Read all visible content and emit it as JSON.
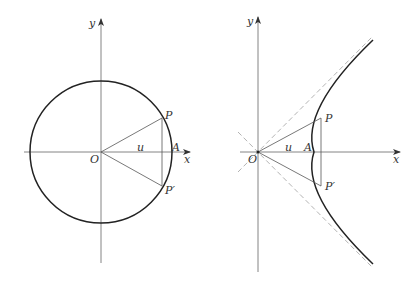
{
  "figure": {
    "colors": {
      "axis": "#555555",
      "curve": "#222222",
      "line": "#555555",
      "asymptote": "#aaaaaa",
      "label": "#333333"
    }
  },
  "left_diagram": {
    "name": "circle",
    "labels": {
      "y_axis": "y",
      "x_axis": "x",
      "origin": "O",
      "point_P": "P",
      "point_P_prime": "P′",
      "point_A": "A",
      "angle": "u"
    }
  },
  "right_diagram": {
    "name": "hyperbola",
    "labels": {
      "y_axis": "y",
      "x_axis": "x",
      "origin": "O",
      "point_P": "P",
      "point_P_prime": "P′",
      "point_A": "A",
      "angle": "u"
    }
  }
}
